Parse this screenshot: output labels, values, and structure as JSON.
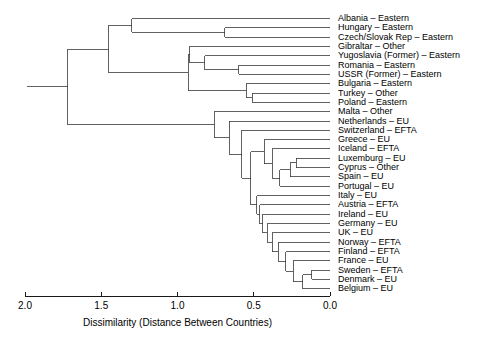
{
  "chart_data": {
    "type": "tree",
    "title": "",
    "xlabel": "Dissimilarity (Distance Between Countries)",
    "ylabel": "",
    "xlim": [
      2.0,
      0.0
    ],
    "axis_reversed": true,
    "grid": false,
    "legend": null,
    "xticks": [
      "2.0",
      "1.5",
      "1.0",
      "0.5",
      "0.0"
    ],
    "xtick_values": [
      2.0,
      1.5,
      1.0,
      0.5,
      0.0
    ],
    "leaf_count": 30,
    "leaves": [
      {
        "label": "Albania – Eastern",
        "country": "Albania",
        "group": "Eastern"
      },
      {
        "label": "Hungary – Eastern",
        "country": "Hungary",
        "group": "Eastern"
      },
      {
        "label": "Czech/Slovak Rep – Eastern",
        "country": "Czech/Slovak Rep",
        "group": "Eastern"
      },
      {
        "label": "Gibraltar – Other",
        "country": "Gibraltar",
        "group": "Other"
      },
      {
        "label": "Yugoslavia (Former) – Eastern",
        "country": "Yugoslavia (Former)",
        "group": "Eastern"
      },
      {
        "label": "Romania – Eastern",
        "country": "Romania",
        "group": "Eastern"
      },
      {
        "label": "USSR (Former) – Eastern",
        "country": "USSR (Former)",
        "group": "Eastern"
      },
      {
        "label": "Bulgaria – Eastern",
        "country": "Bulgaria",
        "group": "Eastern"
      },
      {
        "label": "Turkey – Other",
        "country": "Turkey",
        "group": "Other"
      },
      {
        "label": "Poland – Eastern",
        "country": "Poland",
        "group": "Eastern"
      },
      {
        "label": "Malta – Other",
        "country": "Malta",
        "group": "Other"
      },
      {
        "label": "Netherlands – EU",
        "country": "Netherlands",
        "group": "EU"
      },
      {
        "label": "Switzerland – EFTA",
        "country": "Switzerland",
        "group": "EFTA"
      },
      {
        "label": "Greece – EU",
        "country": "Greece",
        "group": "EU"
      },
      {
        "label": "Iceland – EFTA",
        "country": "Iceland",
        "group": "EFTA"
      },
      {
        "label": "Luxemburg – EU",
        "country": "Luxemburg",
        "group": "EU"
      },
      {
        "label": "Cyprus – Other",
        "country": "Cyprus",
        "group": "Other"
      },
      {
        "label": "Spain – EU",
        "country": "Spain",
        "group": "EU"
      },
      {
        "label": "Portugal – EU",
        "country": "Portugal",
        "group": "EU"
      },
      {
        "label": "Italy – EU",
        "country": "Italy",
        "group": "EU"
      },
      {
        "label": "Austria – EFTA",
        "country": "Austria",
        "group": "EFTA"
      },
      {
        "label": "Ireland – EU",
        "country": "Ireland",
        "group": "EU"
      },
      {
        "label": "Germany – EU",
        "country": "Germany",
        "group": "EU"
      },
      {
        "label": "UK – EU",
        "country": "UK",
        "group": "EU"
      },
      {
        "label": "Norway – EFTA",
        "country": "Norway",
        "group": "EFTA"
      },
      {
        "label": "Finland – EFTA",
        "country": "Finland",
        "group": "EFTA"
      },
      {
        "label": "France – EU",
        "country": "France",
        "group": "EU"
      },
      {
        "label": "Sweden – EFTA",
        "country": "Sweden",
        "group": "EFTA"
      },
      {
        "label": "Denmark – EU",
        "country": "Denmark",
        "group": "EU"
      },
      {
        "label": "Belgium – EU",
        "country": "Belgium",
        "group": "EU"
      }
    ],
    "merges": [
      {
        "id": "m1",
        "left": {
          "leaf": 1
        },
        "right": {
          "leaf": 2
        },
        "height": 0.69
      },
      {
        "id": "m2",
        "left": {
          "leaf": 0
        },
        "right": {
          "node": "m1"
        },
        "height": 1.3
      },
      {
        "id": "m3",
        "left": {
          "leaf": 5
        },
        "right": {
          "leaf": 6
        },
        "height": 0.6
      },
      {
        "id": "m4",
        "left": {
          "leaf": 4
        },
        "right": {
          "node": "m3"
        },
        "height": 0.82
      },
      {
        "id": "m5",
        "left": {
          "leaf": 3
        },
        "right": {
          "node": "m4"
        },
        "height": 0.92
      },
      {
        "id": "m6",
        "left": {
          "leaf": 8
        },
        "right": {
          "leaf": 9
        },
        "height": 0.51
      },
      {
        "id": "m7",
        "left": {
          "leaf": 7
        },
        "right": {
          "node": "m6"
        },
        "height": 0.55
      },
      {
        "id": "m8",
        "left": {
          "node": "m5"
        },
        "right": {
          "node": "m7"
        },
        "height": 0.93
      },
      {
        "id": "m9",
        "left": {
          "node": "m2"
        },
        "right": {
          "node": "m8"
        },
        "height": 1.45
      },
      {
        "id": "m10",
        "left": {
          "leaf": 15
        },
        "right": {
          "leaf": 16
        },
        "height": 0.22
      },
      {
        "id": "m11",
        "left": {
          "node": "m10"
        },
        "right": {
          "leaf": 17
        },
        "height": 0.26
      },
      {
        "id": "m12",
        "left": {
          "node": "m11"
        },
        "right": {
          "leaf": 18
        },
        "height": 0.33
      },
      {
        "id": "m13",
        "left": {
          "leaf": 14
        },
        "right": {
          "node": "m12"
        },
        "height": 0.38
      },
      {
        "id": "m14",
        "left": {
          "leaf": 13
        },
        "right": {
          "node": "m13"
        },
        "height": 0.43
      },
      {
        "id": "m15",
        "left": {
          "leaf": 27
        },
        "right": {
          "leaf": 28
        },
        "height": 0.12
      },
      {
        "id": "m16",
        "left": {
          "node": "m15"
        },
        "right": {
          "leaf": 29
        },
        "height": 0.18
      },
      {
        "id": "m17",
        "left": {
          "leaf": 26
        },
        "right": {
          "node": "m16"
        },
        "height": 0.24
      },
      {
        "id": "m18",
        "left": {
          "leaf": 25
        },
        "right": {
          "node": "m17"
        },
        "height": 0.29
      },
      {
        "id": "m19",
        "left": {
          "leaf": 24
        },
        "right": {
          "node": "m18"
        },
        "height": 0.34
      },
      {
        "id": "m20",
        "left": {
          "leaf": 23
        },
        "right": {
          "node": "m19"
        },
        "height": 0.38
      },
      {
        "id": "m21",
        "left": {
          "leaf": 22
        },
        "right": {
          "node": "m20"
        },
        "height": 0.41
      },
      {
        "id": "m22",
        "left": {
          "leaf": 21
        },
        "right": {
          "node": "m21"
        },
        "height": 0.44
      },
      {
        "id": "m23",
        "left": {
          "leaf": 20
        },
        "right": {
          "node": "m22"
        },
        "height": 0.46
      },
      {
        "id": "m24",
        "left": {
          "leaf": 19
        },
        "right": {
          "node": "m23"
        },
        "height": 0.48
      },
      {
        "id": "m25",
        "left": {
          "node": "m14"
        },
        "right": {
          "node": "m24"
        },
        "height": 0.52
      },
      {
        "id": "m26",
        "left": {
          "leaf": 12
        },
        "right": {
          "node": "m25"
        },
        "height": 0.58
      },
      {
        "id": "m27",
        "left": {
          "leaf": 11
        },
        "right": {
          "node": "m26"
        },
        "height": 0.66
      },
      {
        "id": "m28",
        "left": {
          "leaf": 10
        },
        "right": {
          "node": "m27"
        },
        "height": 0.76
      },
      {
        "id": "m29",
        "left": {
          "node": "m9"
        },
        "right": {
          "node": "m28"
        },
        "height": 1.72
      }
    ]
  },
  "axis": {
    "title": "Dissimilarity (Distance Between Countries)"
  },
  "colors": {
    "line": "#3a3a3a",
    "text": "#000000",
    "background": "#ffffff"
  }
}
